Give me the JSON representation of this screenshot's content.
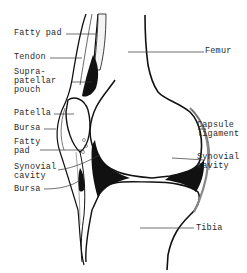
{
  "diagram": {
    "labels": {
      "fatty_pad_top": "Fatty pad",
      "tendon": "Tendon",
      "suprapatellar_1": "Supra-",
      "suprapatellar_2": "patellar",
      "suprapatellar_3": "pouch",
      "patella": "Patella",
      "bursa_top": "Bursa",
      "fatty_pad_low_1": "Fatty",
      "fatty_pad_low_2": "pad",
      "synovial_left_1": "Synovial",
      "synovial_left_2": "cavity",
      "bursa_low": "Bursa",
      "femur": "Femur",
      "capsule_1": "Capsule",
      "capsule_2": "ligament",
      "synovial_right_1": "Synovial",
      "synovial_right_2": "cavity",
      "tibia": "Tibia"
    },
    "colors": {
      "ink": "#111111",
      "label": "#2a2a2a",
      "background": "#ffffff"
    }
  }
}
